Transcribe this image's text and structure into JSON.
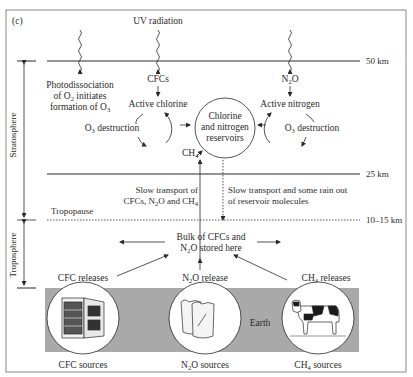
{
  "figure": {
    "panel_label": "(c)",
    "colors": {
      "frame": "#8a8a8a",
      "ink": "#2a2a2a",
      "earth": "#a9a9a9",
      "background": "#ffffff"
    }
  },
  "altitudes": {
    "top": "50 km",
    "middle": "25 km",
    "tropopause": "10–15 km"
  },
  "layers": {
    "stratosphere": "Stratosphere",
    "troposphere": "Troposphere",
    "tropopause": "Tropopause",
    "earth": "Earth"
  },
  "radiation": {
    "label": "UV radiation"
  },
  "stratosphere": {
    "photodissociation": [
      "Photodissociation",
      "of O2 initiates",
      "formation of O3"
    ],
    "cfcs": "CFCs",
    "active_chlorine": "Active chlorine",
    "o3_destruction_left": "O3 destruction",
    "reservoir": [
      "Chlorine",
      "and nitrogen",
      "reservoirs"
    ],
    "ch4": "CH4",
    "n2o": "N2O",
    "active_nitrogen": "Active nitrogen",
    "o3_destruction_right": "O3 destruction"
  },
  "transport": {
    "up": [
      "Slow transport of",
      "CFCs, N2O and CH4"
    ],
    "down": [
      "Slow transport and some rain out",
      "of reservoir molecules"
    ]
  },
  "troposphere": {
    "bulk": [
      "Bulk of CFCs and",
      "N2O stored here"
    ],
    "cfc_releases": "CFC releases",
    "n2o_release": "N2O release",
    "ch4_releases": "CH4 releases"
  },
  "sources": [
    {
      "label": "CFC sources",
      "icon": "refrigerator-icon"
    },
    {
      "label": "N2O sources",
      "icon": "fertilizer-bags-icon"
    },
    {
      "label": "CH4 sources",
      "icon": "cow-icon"
    }
  ]
}
